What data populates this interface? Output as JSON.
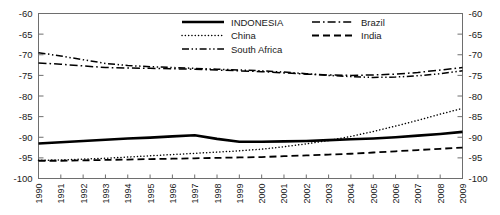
{
  "chart_data": {
    "type": "line",
    "title": "",
    "subtitle": "",
    "xlabel": "",
    "ylabel": "",
    "grid": false,
    "legend_position": "top-right-inside",
    "dual_y_axis": true,
    "xlim": [
      1990,
      2009
    ],
    "ylim": [
      -100,
      -60
    ],
    "yticks": [
      -60,
      -65,
      -70,
      -75,
      -80,
      -85,
      -90,
      -95,
      -100
    ],
    "ytick_labels": [
      "-60",
      "-65",
      "-70",
      "-75",
      "-80",
      "-85",
      "-90",
      "-95",
      "-100"
    ],
    "ytick_labels_right": [
      "-60",
      "-65",
      "-70",
      "-75",
      "-80",
      "-85",
      "-90",
      "-95",
      "-100"
    ],
    "x": [
      1990,
      1991,
      1992,
      1993,
      1994,
      1995,
      1996,
      1997,
      1998,
      1999,
      2000,
      2001,
      2002,
      2003,
      2004,
      2005,
      2006,
      2007,
      2008,
      2009
    ],
    "xtick_labels": [
      "1990",
      "1991",
      "1992",
      "1993",
      "1994",
      "1995",
      "1996",
      "1997",
      "1998",
      "1999",
      "2000",
      "2001",
      "2002",
      "2003",
      "2004",
      "2005",
      "2006",
      "2007",
      "2008",
      "2009"
    ],
    "series": [
      {
        "name": "INDONESIA",
        "style": "solid",
        "color": "#000000",
        "width": 2.6,
        "values": [
          -91.5,
          -91.2,
          -90.9,
          -90.6,
          -90.3,
          -90.1,
          -89.8,
          -89.5,
          -90.4,
          -91.1,
          -91.1,
          -91.0,
          -90.9,
          -90.7,
          -90.5,
          -90.3,
          -90.0,
          -89.6,
          -89.2,
          -88.7
        ]
      },
      {
        "name": "China",
        "style": "dotted",
        "color": "#000000",
        "width": 1.5,
        "values": [
          -95.6,
          -95.5,
          -95.3,
          -95.1,
          -94.8,
          -94.5,
          -94.2,
          -93.9,
          -93.6,
          -93.3,
          -92.9,
          -92.3,
          -91.6,
          -90.8,
          -89.8,
          -88.6,
          -87.3,
          -85.9,
          -84.4,
          -83.0
        ]
      },
      {
        "name": "South Africa",
        "style": "dashdotdot",
        "color": "#000000",
        "width": 1.5,
        "values": [
          -69.5,
          -70.3,
          -71.2,
          -72.1,
          -72.6,
          -72.9,
          -73.1,
          -73.3,
          -73.5,
          -73.7,
          -73.9,
          -74.2,
          -74.6,
          -75.0,
          -75.3,
          -75.5,
          -75.4,
          -75.1,
          -74.6,
          -73.9
        ]
      },
      {
        "name": "Brazil",
        "style": "dashdot",
        "color": "#000000",
        "width": 1.5,
        "values": [
          -72.0,
          -72.3,
          -72.7,
          -73.1,
          -73.2,
          -73.3,
          -73.4,
          -73.5,
          -73.7,
          -73.9,
          -74.1,
          -74.4,
          -74.7,
          -74.9,
          -75.0,
          -74.9,
          -74.7,
          -74.3,
          -73.7,
          -73.1
        ]
      },
      {
        "name": "India",
        "style": "dashed",
        "color": "#000000",
        "width": 1.8,
        "values": [
          -95.7,
          -95.7,
          -95.6,
          -95.5,
          -95.4,
          -95.3,
          -95.2,
          -95.1,
          -95.0,
          -94.9,
          -94.8,
          -94.6,
          -94.4,
          -94.2,
          -94.0,
          -93.7,
          -93.4,
          -93.1,
          -92.8,
          -92.5
        ]
      }
    ],
    "annotations": []
  },
  "legend": {
    "entries": [
      {
        "label": "INDONESIA",
        "style": "solid"
      },
      {
        "label": "Brazil",
        "style": "dashdot"
      },
      {
        "label": "China",
        "style": "dotted"
      },
      {
        "label": "India",
        "style": "dashed"
      },
      {
        "label": "South Africa",
        "style": "dashdotdot"
      }
    ]
  },
  "colors": {
    "line": "#000000",
    "axis": "#6e6e6e",
    "text": "#1a1a1a",
    "background": "#ffffff"
  }
}
